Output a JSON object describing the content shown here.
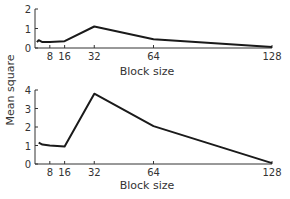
{
  "chart_data": [
    {
      "type": "line",
      "title": "",
      "xlabel": "Block size",
      "ylabel": "Mean square",
      "x_ticks": [
        8,
        16,
        32,
        64,
        128
      ],
      "y_ticks": [
        0,
        1,
        2
      ],
      "xlim": [
        0,
        128
      ],
      "ylim": [
        0,
        2
      ],
      "grid": false,
      "legend": null,
      "series": [
        {
          "name": "upper",
          "x": [
            1,
            2,
            4,
            8,
            16,
            32,
            64,
            128
          ],
          "y": [
            0.3,
            0.4,
            0.3,
            0.3,
            0.35,
            1.1,
            0.45,
            0.05
          ]
        }
      ]
    },
    {
      "type": "line",
      "title": "",
      "xlabel": "Block size",
      "ylabel": "Mean square",
      "x_ticks": [
        8,
        16,
        32,
        64,
        128
      ],
      "y_ticks": [
        0,
        1,
        2,
        3,
        4
      ],
      "xlim": [
        0,
        128
      ],
      "ylim": [
        0,
        4
      ],
      "grid": false,
      "legend": null,
      "series": [
        {
          "name": "lower",
          "x": [
            2,
            4,
            8,
            16,
            32,
            64,
            128
          ],
          "y": [
            1.15,
            1.05,
            1.0,
            0.95,
            3.8,
            2.05,
            0.05
          ]
        }
      ]
    }
  ],
  "labels": {
    "shared_ylabel": "Mean square",
    "top_xlabel": "Block size",
    "bottom_xlabel": "Block size"
  }
}
